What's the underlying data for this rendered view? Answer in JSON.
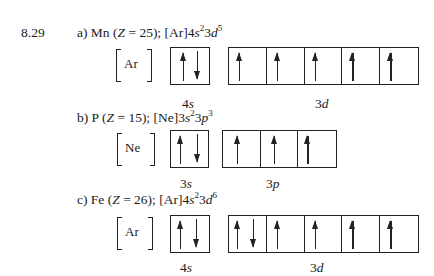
{
  "problem_number": "8.29",
  "parts": [
    {
      "id": "a",
      "prefix": "a) Mn (",
      "z_var": "Z",
      "z_eq": " = 25); [Ar]4",
      "config_terms": [
        {
          "n": "4",
          "l": "s",
          "e": "2"
        },
        {
          "n": "3",
          "l": "d",
          "e": "5"
        }
      ],
      "core": "Ar",
      "subshells": [
        {
          "label_n": "4",
          "label_l": "s",
          "orbitals": [
            [
              "up",
              "down"
            ]
          ]
        },
        {
          "label_n": "3",
          "label_l": "d",
          "orbitals": [
            [
              "up"
            ],
            [
              "up"
            ],
            [
              "up"
            ],
            [
              "up"
            ],
            [
              "up"
            ]
          ]
        }
      ]
    },
    {
      "id": "b",
      "prefix": "b) P (",
      "z_var": "Z",
      "z_eq": " = 15); [Ne]3",
      "config_terms": [
        {
          "n": "3",
          "l": "s",
          "e": "2"
        },
        {
          "n": "3",
          "l": "p",
          "e": "3"
        }
      ],
      "core": "Ne",
      "subshells": [
        {
          "label_n": "3",
          "label_l": "s",
          "orbitals": [
            [
              "up",
              "down"
            ]
          ]
        },
        {
          "label_n": "3",
          "label_l": "p",
          "orbitals": [
            [
              "up"
            ],
            [
              "up"
            ],
            [
              "up"
            ]
          ]
        }
      ]
    },
    {
      "id": "c",
      "prefix": "c) Fe (",
      "z_var": "Z",
      "z_eq": " = 26); [Ar]4",
      "config_terms": [
        {
          "n": "4",
          "l": "s",
          "e": "2"
        },
        {
          "n": "3",
          "l": "d",
          "e": "6"
        }
      ],
      "core": "Ar",
      "subshells": [
        {
          "label_n": "4",
          "label_l": "s",
          "orbitals": [
            [
              "up",
              "down"
            ]
          ]
        },
        {
          "label_n": "3",
          "label_l": "d",
          "orbitals": [
            [
              "up",
              "down"
            ],
            [
              "up"
            ],
            [
              "up"
            ],
            [
              "up"
            ],
            [
              "up"
            ]
          ]
        }
      ]
    }
  ],
  "text": {
    "a_head": "a) Mn (",
    "a_tail": " = 25); [Ar]4",
    "b_head": "b) P (",
    "b_tail": " = 15); [Ne]3",
    "c_head": "c) Fe (",
    "c_tail": " = 26); [Ar]4",
    "z": "Z",
    "s": "s",
    "p": "p",
    "d": "d",
    "three": "3",
    "four": "4",
    "e2": "2",
    "e3": "3",
    "e5": "5",
    "e6": "6",
    "ar": "Ar",
    "ne": "Ne"
  }
}
